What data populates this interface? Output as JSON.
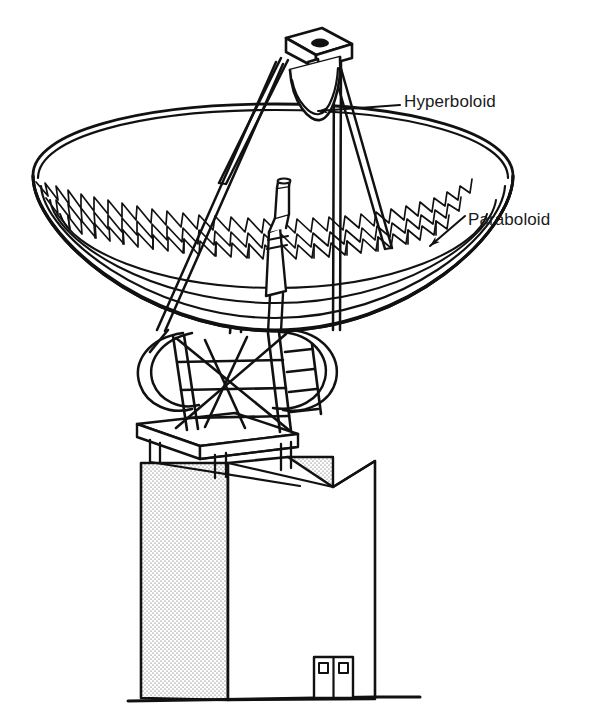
{
  "figure": {
    "kind": "line-art-technical-diagram",
    "background_color": "#ffffff",
    "line_color": "#111111",
    "stipple_color": "#4a4a4a"
  },
  "labels": {
    "hyperboloid": {
      "text": "Hyperboloid",
      "leader": "horizontal line with arrowhead pointing left to subreflector"
    },
    "paraboloid": {
      "text": "Paraboloid",
      "leader": "short line with arrow pointing down-left to dish surface"
    }
  },
  "parts": {
    "dish": "paraboloid-reflector",
    "dish_truss": "triangular-lattice-backup-structure",
    "subreflector": "hyperboloid-subreflector",
    "apex_platform": "tripod-apex-platform",
    "tripod": "three-leg-feed-support",
    "feed_horn": "feed-horn",
    "mount": "elevation-azimuth-mount-truss",
    "arc_rails": "elevation-arc-rails",
    "pedestal": "platform-slab",
    "building": "equipment-building",
    "door": "double-door",
    "ground": "ground-line"
  },
  "colors": {
    "ink": "#111111",
    "paper": "#ffffff",
    "stipple": "#555555"
  }
}
